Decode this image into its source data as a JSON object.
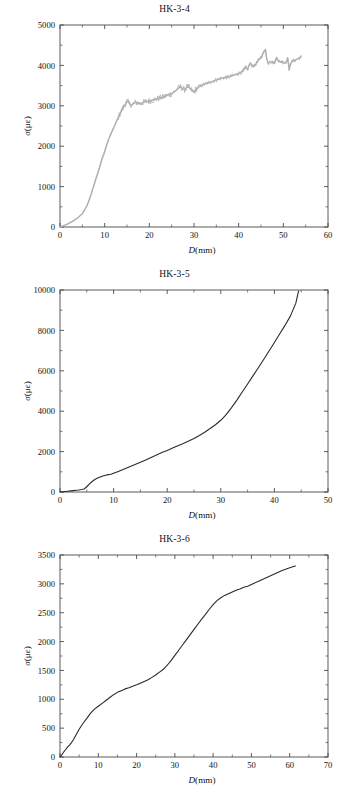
{
  "figure": {
    "panel_count": 3,
    "background_color": "#ffffff"
  },
  "panels": [
    {
      "title": "HK-3-4",
      "xlabel_var": "D",
      "xlabel_unit": "(mm)",
      "ylabel_var": "σ",
      "ylabel_unit": "(με)"
    },
    {
      "title": "HK-3-5",
      "xlabel_var": "D",
      "xlabel_unit": "(mm)",
      "ylabel_var": "σ",
      "ylabel_unit": "(με)"
    },
    {
      "title": "HK-3-6",
      "xlabel_var": "D",
      "xlabel_unit": "(mm)",
      "ylabel_var": "σ",
      "ylabel_unit": "(με)"
    }
  ],
  "chart_data": [
    {
      "type": "line",
      "title": "HK-3-4",
      "xlabel": "D (mm)",
      "ylabel": "σ (με)",
      "xlim": [
        0,
        60
      ],
      "ylim": [
        0,
        5000
      ],
      "xticks": [
        0,
        10,
        20,
        30,
        40,
        50,
        60
      ],
      "yticks": [
        0,
        1000,
        2000,
        3000,
        4000,
        5000
      ],
      "grid": false,
      "legend": null,
      "line_color": "#b0b0b0",
      "series": [
        {
          "name": "HK-3-4 strain",
          "x": [
            0.0,
            1.0,
            2.0,
            3.0,
            4.0,
            5.0,
            5.5,
            6.0,
            6.5,
            7.0,
            7.5,
            8.0,
            8.5,
            9.0,
            9.5,
            9.8,
            10.0,
            10.5,
            11.0,
            11.5,
            12.0,
            12.5,
            13.0,
            13.5,
            14.0,
            14.5,
            15.0,
            15.5,
            16.0,
            16.5,
            17.0,
            18.0,
            19.0,
            20.0,
            21.0,
            22.0,
            23.0,
            24.0,
            25.0,
            26.0,
            26.5,
            27.0,
            27.5,
            28.0,
            28.5,
            29.0,
            29.5,
            30.0,
            30.5,
            31.0,
            32.0,
            33.0,
            34.0,
            35.0,
            36.0,
            37.0,
            38.0,
            39.0,
            40.0,
            41.0,
            41.5,
            42.0,
            42.5,
            43.0,
            43.5,
            44.0,
            44.5,
            45.0,
            45.5,
            46.0,
            46.3,
            46.6,
            47.0,
            47.5,
            48.0,
            48.5,
            49.0,
            49.5,
            50.0,
            50.5,
            51.0,
            51.3,
            51.6,
            52.0,
            52.5,
            53.0,
            53.5,
            54.0
          ],
          "y": [
            0,
            40,
            90,
            150,
            230,
            330,
            420,
            520,
            660,
            820,
            1000,
            1180,
            1350,
            1530,
            1720,
            1800,
            1870,
            2050,
            2200,
            2330,
            2450,
            2580,
            2700,
            2820,
            2930,
            3020,
            3120,
            3060,
            3010,
            3060,
            3090,
            3050,
            3100,
            3120,
            3150,
            3180,
            3210,
            3260,
            3300,
            3380,
            3440,
            3470,
            3420,
            3400,
            3480,
            3440,
            3380,
            3340,
            3420,
            3460,
            3520,
            3560,
            3600,
            3640,
            3680,
            3700,
            3720,
            3760,
            3800,
            3860,
            3960,
            3900,
            4050,
            4000,
            3980,
            4060,
            4140,
            4200,
            4300,
            4400,
            4150,
            4050,
            4100,
            4080,
            4060,
            4200,
            4090,
            4100,
            4080,
            4060,
            4180,
            3880,
            4050,
            4100,
            4120,
            4150,
            4180,
            4210
          ]
        }
      ]
    },
    {
      "type": "line",
      "title": "HK-3-5",
      "xlabel": "D (mm)",
      "ylabel": "σ (με)",
      "xlim": [
        0,
        50
      ],
      "ylim": [
        0,
        10000
      ],
      "xticks": [
        0,
        10,
        20,
        30,
        40,
        50
      ],
      "yticks": [
        0,
        2000,
        4000,
        6000,
        8000,
        10000
      ],
      "grid": false,
      "legend": null,
      "line_color": "#2a2a2a",
      "series": [
        {
          "name": "HK-3-5 strain",
          "x": [
            0.0,
            0.5,
            1.0,
            1.5,
            2.0,
            2.5,
            3.0,
            3.5,
            4.0,
            4.5,
            5.0,
            5.5,
            6.0,
            6.5,
            7.0,
            7.5,
            8.0,
            8.5,
            9.0,
            9.5,
            10.0,
            11.0,
            12.0,
            13.0,
            14.0,
            15.0,
            16.0,
            17.0,
            18.0,
            19.0,
            20.0,
            21.0,
            22.0,
            23.0,
            24.0,
            25.0,
            26.0,
            27.0,
            28.0,
            29.0,
            30.0,
            31.0,
            32.0,
            33.0,
            34.0,
            35.0,
            36.0,
            37.0,
            38.0,
            39.0,
            40.0,
            41.0,
            42.0,
            43.0,
            44.0,
            44.5
          ],
          "y": [
            0,
            10,
            25,
            40,
            55,
            70,
            85,
            100,
            120,
            150,
            260,
            400,
            520,
            620,
            690,
            740,
            790,
            830,
            860,
            880,
            930,
            1030,
            1140,
            1250,
            1360,
            1470,
            1590,
            1710,
            1830,
            1950,
            2060,
            2180,
            2290,
            2400,
            2520,
            2650,
            2800,
            2960,
            3140,
            3330,
            3550,
            3830,
            4180,
            4550,
            4950,
            5350,
            5750,
            6150,
            6560,
            6980,
            7400,
            7830,
            8260,
            8720,
            9350,
            9950
          ]
        }
      ]
    },
    {
      "type": "line",
      "title": "HK-3-6",
      "xlabel": "D (mm)",
      "ylabel": "σ (με)",
      "xlim": [
        0,
        70
      ],
      "ylim": [
        0,
        3500
      ],
      "xticks": [
        0,
        10,
        20,
        30,
        40,
        50,
        60,
        70
      ],
      "yticks": [
        0,
        500,
        1000,
        1500,
        2000,
        2500,
        3000,
        3500
      ],
      "grid": false,
      "legend": null,
      "line_color": "#2a2a2a",
      "series": [
        {
          "name": "HK-3-6 strain",
          "x": [
            0.0,
            0.5,
            1.0,
            1.5,
            2.0,
            2.5,
            3.0,
            3.5,
            4.0,
            4.5,
            5.0,
            6.0,
            7.0,
            8.0,
            9.0,
            10.0,
            11.0,
            12.0,
            13.0,
            14.0,
            15.0,
            16.0,
            17.0,
            18.0,
            19.0,
            20.0,
            21.0,
            22.0,
            23.0,
            24.0,
            25.0,
            26.0,
            27.0,
            28.0,
            29.0,
            30.0,
            31.0,
            32.0,
            33.0,
            34.0,
            35.0,
            36.0,
            37.0,
            38.0,
            39.0,
            40.0,
            41.0,
            42.0,
            43.0,
            44.0,
            45.0,
            46.0,
            47.0,
            48.0,
            49.0,
            50.0,
            52.0,
            54.0,
            56.0,
            58.0,
            60.0,
            61.0,
            61.5
          ],
          "y": [
            0,
            40,
            90,
            130,
            175,
            205,
            250,
            300,
            360,
            420,
            480,
            580,
            670,
            760,
            830,
            880,
            930,
            980,
            1030,
            1080,
            1120,
            1150,
            1180,
            1200,
            1225,
            1250,
            1280,
            1310,
            1340,
            1380,
            1420,
            1470,
            1520,
            1590,
            1670,
            1760,
            1850,
            1940,
            2030,
            2120,
            2210,
            2300,
            2390,
            2470,
            2560,
            2640,
            2710,
            2760,
            2800,
            2830,
            2860,
            2890,
            2910,
            2940,
            2960,
            2990,
            3050,
            3110,
            3170,
            3230,
            3280,
            3300,
            3310
          ]
        }
      ]
    }
  ]
}
